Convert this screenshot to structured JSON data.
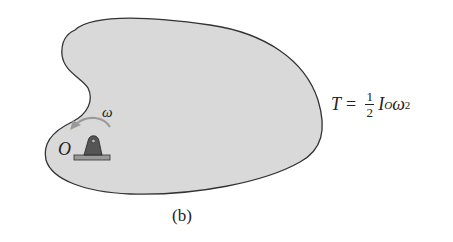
{
  "figure": {
    "caption": "(b)",
    "body_fill": "#d9d9d9",
    "outline_color": "#333333",
    "pin": {
      "label": "O",
      "body_color": "#555555",
      "base_color": "#999999"
    },
    "rotation": {
      "symbol": "ω",
      "arrow_color": "#9a9a9a",
      "direction": "counterclockwise"
    },
    "equation": {
      "lhs": "T",
      "equals": "=",
      "frac_num": "1",
      "frac_den": "2",
      "inertia": "I",
      "inertia_sub": "O",
      "omega": "ω",
      "omega_exp": "2"
    }
  }
}
